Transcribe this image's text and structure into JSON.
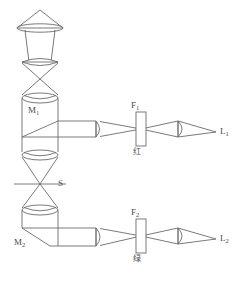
{
  "diagram": {
    "stroke_color": "#6b6b6b",
    "background_color": "#ffffff",
    "label_color": "#4a4a4a",
    "width": 243,
    "height": 282
  },
  "labels": {
    "mirror_1": "M",
    "mirror_1_sub": "1",
    "mirror_2": "M",
    "mirror_2_sub": "2",
    "slit": "S",
    "filter_1": "F",
    "filter_1_sub": "1",
    "filter_2": "F",
    "filter_2_sub": "2",
    "filter_1_color_cn": "红",
    "filter_2_color_cn": "绿",
    "output_1": "L",
    "output_1_sub": "1",
    "output_2": "L",
    "output_2_sub": "2"
  },
  "components": [
    {
      "name": "lamp-reflector",
      "type": "conical-reflector"
    },
    {
      "name": "condenser-lens-upper",
      "type": "biconvex-lens"
    },
    {
      "name": "collector-lens",
      "type": "biconvex-lens"
    },
    {
      "name": "beam-splitter-m1",
      "type": "prism-box-with-diagonal"
    },
    {
      "name": "relay-lens-lower",
      "type": "biconvex-lens"
    },
    {
      "name": "slit-s",
      "type": "aperture-slit"
    },
    {
      "name": "condenser-lens-lower",
      "type": "biconvex-lens"
    },
    {
      "name": "mirror-m2",
      "type": "prism-box-with-diagonal"
    },
    {
      "name": "objective-lens-upper",
      "type": "plano-convex-lens"
    },
    {
      "name": "filter-f1",
      "type": "filter-plate"
    },
    {
      "name": "projection-lens-upper",
      "type": "plano-convex-lens"
    },
    {
      "name": "objective-lens-lower",
      "type": "plano-convex-lens"
    },
    {
      "name": "filter-f2",
      "type": "filter-plate"
    },
    {
      "name": "projection-lens-lower",
      "type": "plano-convex-lens"
    }
  ]
}
